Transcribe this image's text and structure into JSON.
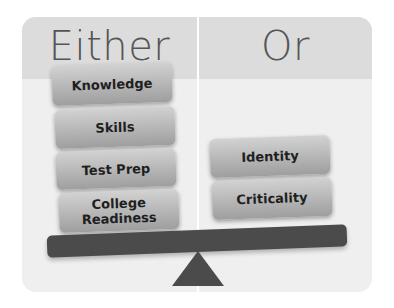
{
  "diagram": {
    "left_heading": "Either",
    "right_heading": "Or",
    "left_items": [
      "Knowledge",
      "Skills",
      "Test Prep",
      "College Readiness"
    ],
    "right_items": [
      "Identity",
      "Criticality"
    ],
    "colors": {
      "header": "#dcdcdc",
      "panel": "#efefef",
      "beam": "#4b4b4b",
      "box_top": "#d2d2d2",
      "box_bottom": "#9e9e9e",
      "text": "#1f1f1f"
    }
  }
}
